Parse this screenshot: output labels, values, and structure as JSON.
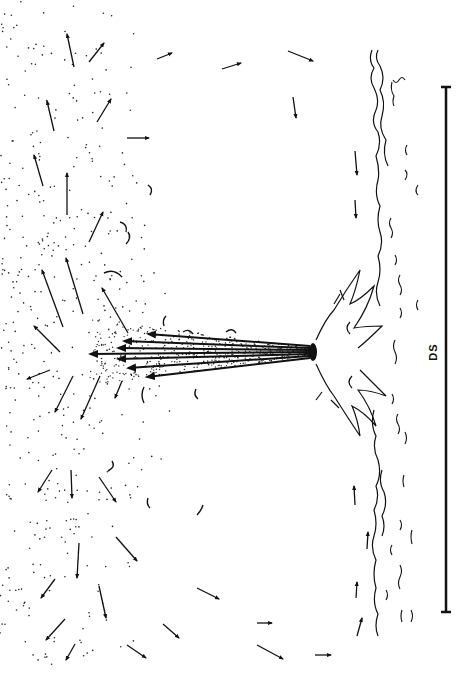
{
  "figure": {
    "orientation": "rotated-90-ccw",
    "colors": {
      "ink": "#111111",
      "background": "#ffffff",
      "caption": "#bbbbbb"
    },
    "scale_bar": {
      "label": "DS",
      "x": 446,
      "y_top": 86,
      "y_bottom": 612
    },
    "vent": {
      "x": 312,
      "y": 352
    },
    "jet_arrows": [
      {
        "x1": 310,
        "y1": 346,
        "x2": 148,
        "y2": 334
      },
      {
        "x1": 310,
        "y1": 348,
        "x2": 124,
        "y2": 341
      },
      {
        "x1": 310,
        "y1": 350,
        "x2": 118,
        "y2": 348
      },
      {
        "x1": 310,
        "y1": 352,
        "x2": 90,
        "y2": 354
      },
      {
        "x1": 310,
        "y1": 354,
        "x2": 118,
        "y2": 359
      },
      {
        "x1": 310,
        "y1": 356,
        "x2": 128,
        "y2": 368
      },
      {
        "x1": 310,
        "y1": 358,
        "x2": 147,
        "y2": 377
      }
    ],
    "flow_arrows": [
      {
        "x1": 74,
        "y1": 67,
        "x2": 67,
        "y2": 34
      },
      {
        "x1": 89,
        "y1": 62,
        "x2": 104,
        "y2": 43
      },
      {
        "x1": 157,
        "y1": 59,
        "x2": 172,
        "y2": 53
      },
      {
        "x1": 54,
        "y1": 131,
        "x2": 47,
        "y2": 101
      },
      {
        "x1": 97,
        "y1": 122,
        "x2": 111,
        "y2": 99
      },
      {
        "x1": 127,
        "y1": 138,
        "x2": 149,
        "y2": 138
      },
      {
        "x1": 43,
        "y1": 186,
        "x2": 34,
        "y2": 155
      },
      {
        "x1": 67,
        "y1": 215,
        "x2": 67,
        "y2": 173
      },
      {
        "x1": 89,
        "y1": 242,
        "x2": 103,
        "y2": 212
      },
      {
        "x1": 63,
        "y1": 327,
        "x2": 42,
        "y2": 270
      },
      {
        "x1": 83,
        "y1": 314,
        "x2": 66,
        "y2": 258
      },
      {
        "x1": 128,
        "y1": 333,
        "x2": 102,
        "y2": 288
      },
      {
        "x1": 60,
        "y1": 352,
        "x2": 34,
        "y2": 326
      },
      {
        "x1": 50,
        "y1": 370,
        "x2": 27,
        "y2": 379
      },
      {
        "x1": 73,
        "y1": 376,
        "x2": 55,
        "y2": 412
      },
      {
        "x1": 100,
        "y1": 376,
        "x2": 81,
        "y2": 419
      },
      {
        "x1": 122,
        "y1": 381,
        "x2": 115,
        "y2": 398
      },
      {
        "x1": 52,
        "y1": 470,
        "x2": 38,
        "y2": 492
      },
      {
        "x1": 71,
        "y1": 470,
        "x2": 72,
        "y2": 498
      },
      {
        "x1": 99,
        "y1": 477,
        "x2": 116,
        "y2": 502
      },
      {
        "x1": 79,
        "y1": 543,
        "x2": 77,
        "y2": 578
      },
      {
        "x1": 116,
        "y1": 537,
        "x2": 137,
        "y2": 561
      },
      {
        "x1": 55,
        "y1": 579,
        "x2": 41,
        "y2": 598
      },
      {
        "x1": 99,
        "y1": 586,
        "x2": 106,
        "y2": 618
      },
      {
        "x1": 65,
        "y1": 619,
        "x2": 46,
        "y2": 640
      },
      {
        "x1": 75,
        "y1": 644,
        "x2": 66,
        "y2": 660
      },
      {
        "x1": 197,
        "y1": 588,
        "x2": 219,
        "y2": 599
      },
      {
        "x1": 163,
        "y1": 624,
        "x2": 179,
        "y2": 638
      },
      {
        "x1": 127,
        "y1": 645,
        "x2": 146,
        "y2": 658
      },
      {
        "x1": 257,
        "y1": 623,
        "x2": 272,
        "y2": 623
      },
      {
        "x1": 257,
        "y1": 645,
        "x2": 283,
        "y2": 659
      },
      {
        "x1": 315,
        "y1": 655,
        "x2": 331,
        "y2": 655
      },
      {
        "x1": 222,
        "y1": 69,
        "x2": 241,
        "y2": 63
      },
      {
        "x1": 288,
        "y1": 51,
        "x2": 313,
        "y2": 61
      },
      {
        "x1": 293,
        "y1": 97,
        "x2": 296,
        "y2": 118
      },
      {
        "x1": 355,
        "y1": 151,
        "x2": 357,
        "y2": 175
      },
      {
        "x1": 355,
        "y1": 200,
        "x2": 356,
        "y2": 218
      },
      {
        "x1": 355,
        "y1": 505,
        "x2": 354,
        "y2": 486
      },
      {
        "x1": 367,
        "y1": 549,
        "x2": 368,
        "y2": 532
      },
      {
        "x1": 356,
        "y1": 598,
        "x2": 357,
        "y2": 582
      },
      {
        "x1": 357,
        "y1": 636,
        "x2": 362,
        "y2": 618
      }
    ],
    "caption_text": "Fig. (fragment, cropped)"
  }
}
